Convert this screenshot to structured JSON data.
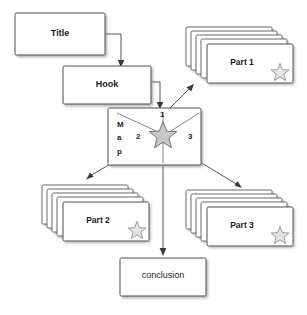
{
  "diagram": {
    "background_color": "#ffffff",
    "stroke_color": "#4d4d4d",
    "text_color": "#1a1a1a",
    "star_fill_color": "#c8c8c8",
    "star_outline_color": "#8c8c8c",
    "shadow_color": "#b0b0b0"
  },
  "boxes": [
    {
      "id": "title",
      "label": "Title",
      "x": 15,
      "y": 13,
      "w": 90,
      "h": 42
    },
    {
      "id": "hook",
      "label": "Hook",
      "x": 63,
      "y": 66,
      "w": 88,
      "h": 38
    },
    {
      "id": "map",
      "label": "Map",
      "x": 108,
      "y": 108,
      "w": 93,
      "h": 57
    },
    {
      "id": "conclusion",
      "label": "conclusion",
      "x": 120,
      "y": 258,
      "w": 86,
      "h": 38
    }
  ],
  "map_box": {
    "vertical_letters": [
      "M",
      "a",
      "p"
    ],
    "branch_numbers": [
      "1",
      "2",
      "3"
    ],
    "center_icon": "star-icon"
  },
  "card_stacks": [
    {
      "id": "part1",
      "label": "Part 1",
      "x": 207,
      "y": 44,
      "w": 86,
      "h": 39,
      "cards": 5,
      "star": "star-outline-icon"
    },
    {
      "id": "part2",
      "label": "Part 2",
      "x": 63,
      "y": 202,
      "w": 86,
      "h": 39,
      "cards": 5,
      "star": "star-outline-icon"
    },
    {
      "id": "part3",
      "label": "Part 3",
      "x": 207,
      "y": 207,
      "w": 86,
      "h": 39,
      "cards": 5,
      "star": "star-outline-icon"
    }
  ],
  "connectors": [
    {
      "id": "title-to-hook",
      "from": "title",
      "to": "hook",
      "style": "elbow",
      "arrowhead": "down"
    },
    {
      "id": "hook-to-map",
      "from": "hook",
      "to": "map",
      "style": "elbow",
      "arrowhead": "down"
    },
    {
      "id": "map-to-part1",
      "from": "map",
      "to": "part1",
      "style": "diagonal",
      "arrowhead": "up-right",
      "branch": "1"
    },
    {
      "id": "map-to-part2",
      "from": "map",
      "to": "part2",
      "style": "diagonal",
      "arrowhead": "down-left",
      "branch": "2"
    },
    {
      "id": "map-to-part3",
      "from": "map",
      "to": "part3",
      "style": "diagonal",
      "arrowhead": "down-right",
      "branch": "3"
    },
    {
      "id": "map-to-conclusion",
      "from": "map",
      "to": "conclusion",
      "style": "straight",
      "arrowhead": "down"
    }
  ]
}
